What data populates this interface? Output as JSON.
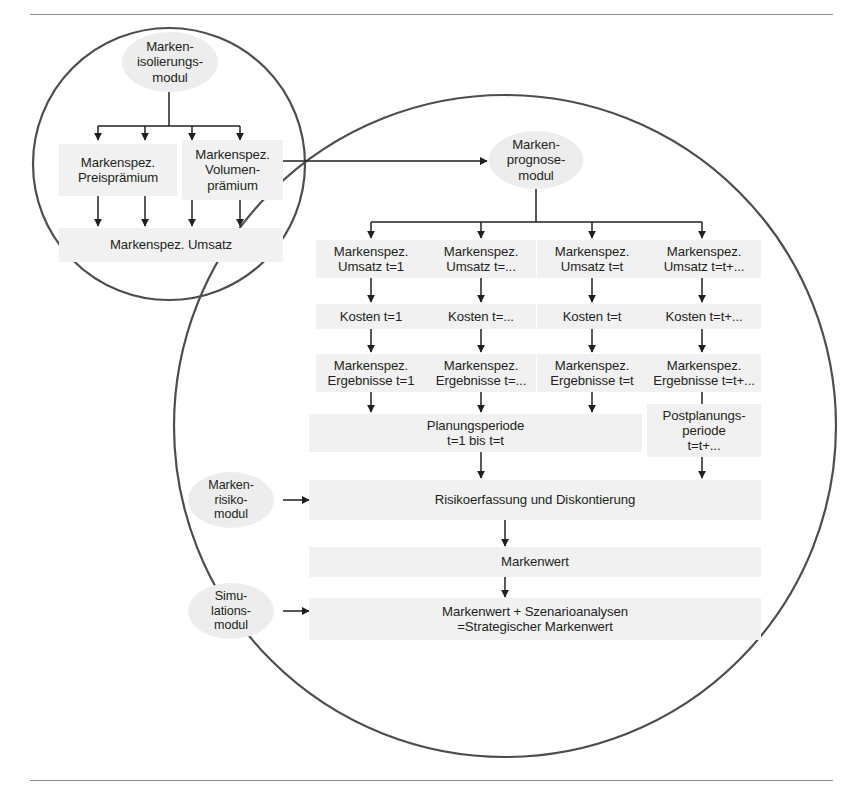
{
  "figure": {
    "title_text": "",
    "background": "#ffffff",
    "rule_color": "#8c8c8c",
    "node_fill": "#f1f1f1",
    "ellipse_fill": "#ededed",
    "stroke_color": "#4d4d4d",
    "text_color": "#231f20"
  },
  "diagram": {
    "type": "flowchart",
    "language": "de",
    "groups": [
      {
        "name": "markenisolierungsmodul-circle",
        "shape": "circle",
        "label": ""
      },
      {
        "name": "markenprognosemodul-circle",
        "shape": "circle",
        "label": ""
      }
    ],
    "modules": {
      "isolation": "Marken-\nisolierungs-\nmodul",
      "forecast": "Marken-\nprognose-\nmodul",
      "risk": "Marken-\nrisiko-\nmodul",
      "simulation": "Simu-\nlations-\nmodul"
    },
    "isolation_branch": {
      "price_premium": "Markenspez.\nPreisprämium",
      "volume_premium": "Markenspez.\nVolumen-\nprämium",
      "revenue": "Markenspez. Umsatz"
    },
    "forecast_columns": [
      {
        "revenue": "Markenspez.\nUmsatz t=1",
        "cost": "Kosten t=1",
        "result": "Markenspez.\nErgebnisse t=1"
      },
      {
        "revenue": "Markenspez.\nUmsatz t=...",
        "cost": "Kosten t=...",
        "result": "Markenspez.\nErgebnisse t=..."
      },
      {
        "revenue": "Markenspez.\nUmsatz t=t",
        "cost": "Kosten t=t",
        "result": "Markenspez.\nErgebnisse t=t"
      },
      {
        "revenue": "Markenspez.\nUmsatz t=t+...",
        "cost": "Kosten t=t+...",
        "result": "Markenspez.\nErgebnisse t=t+..."
      }
    ],
    "periods": {
      "planning": "Planungsperiode\nt=1 bis t=t",
      "post_planning": "Postplanungs-\nperiode\nt=t+..."
    },
    "aggregation": {
      "risk_discount": "Risikoerfassung und Diskontierung",
      "brand_value": "Markenwert",
      "strategic_brand_value": "Markenwert + Szenarioanalysen\n=Strategischer Markenwert"
    }
  }
}
